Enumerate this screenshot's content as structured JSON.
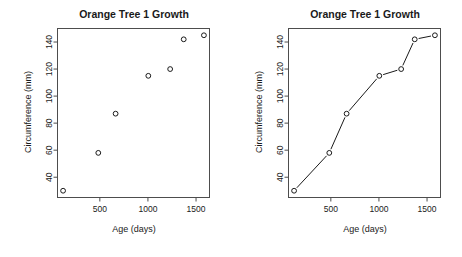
{
  "figure": {
    "width": 462,
    "height": 257,
    "background": "#ffffff",
    "foreground": "#1a1a1a",
    "panel_count": 2
  },
  "chart_data": [
    {
      "type": "scatter",
      "panel": "left",
      "title": "Orange Tree 1 Growth",
      "xlabel": "Age (days)",
      "ylabel": "Circumference (mm)",
      "x": [
        118,
        484,
        664,
        1004,
        1231,
        1372,
        1582
      ],
      "values": [
        30,
        58,
        87,
        115,
        120,
        142,
        145
      ],
      "xlim": [
        60,
        1640
      ],
      "ylim": [
        25,
        150
      ],
      "xticks": [
        500,
        1000,
        1500
      ],
      "xtick_labels": [
        "500",
        "1000",
        "1500"
      ],
      "yticks": [
        40,
        60,
        80,
        100,
        120,
        140
      ],
      "ytick_labels": [
        "40",
        "60",
        "80",
        "100",
        "120",
        "140"
      ],
      "grid": false,
      "legend": "none",
      "marker": "open-circle",
      "marker_size": 2.4,
      "line": false,
      "point_color": "#1a1a1a",
      "box_color": "#4d4d4d"
    },
    {
      "type": "line",
      "panel": "right",
      "title": "Orange Tree 1 Growth",
      "xlabel": "Age (days)",
      "ylabel": "Circumference (mm)",
      "x": [
        118,
        484,
        664,
        1004,
        1231,
        1372,
        1582
      ],
      "values": [
        30,
        58,
        87,
        115,
        120,
        142,
        145
      ],
      "xlim": [
        60,
        1640
      ],
      "ylim": [
        25,
        150
      ],
      "xticks": [
        500,
        1000,
        1500
      ],
      "xtick_labels": [
        "500",
        "1000",
        "1500"
      ],
      "yticks": [
        40,
        60,
        80,
        100,
        120,
        140
      ],
      "ytick_labels": [
        "40",
        "60",
        "80",
        "100",
        "120",
        "140"
      ],
      "grid": false,
      "legend": "none",
      "marker": "open-circle",
      "marker_size": 2.4,
      "line": true,
      "line_style": "both-with-gaps",
      "point_color": "#1a1a1a",
      "line_color": "#1a1a1a",
      "box_color": "#4d4d4d"
    }
  ]
}
